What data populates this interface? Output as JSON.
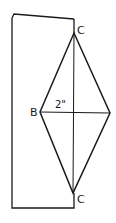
{
  "diagram": {
    "type": "folded-paper-rhombus",
    "colors": {
      "stroke": "#1a1a1a",
      "background": "#ffffff"
    },
    "labels": {
      "top_vertex": "C",
      "bottom_vertex": "C",
      "left_vertex": "B",
      "measurement": "2\""
    }
  }
}
